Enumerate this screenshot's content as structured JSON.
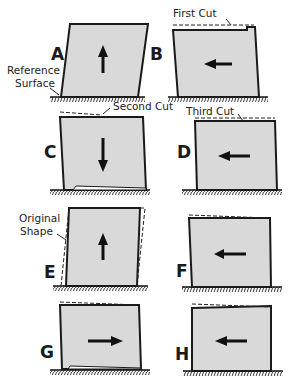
{
  "diagram": {
    "title": "",
    "panels": [
      {
        "id": "A",
        "label": "A",
        "arrow_direction": "up"
      },
      {
        "id": "B",
        "label": "B",
        "arrow_direction": "left"
      },
      {
        "id": "C",
        "label": "C",
        "arrow_direction": "down"
      },
      {
        "id": "D",
        "label": "D",
        "arrow_direction": "left"
      },
      {
        "id": "E",
        "label": "E",
        "arrow_direction": "up"
      },
      {
        "id": "F",
        "label": "F",
        "arrow_direction": "left"
      },
      {
        "id": "G",
        "label": "G",
        "arrow_direction": "right"
      },
      {
        "id": "H",
        "label": "H",
        "arrow_direction": "left"
      }
    ],
    "annotations": {
      "reference_surface_line1": "Reference",
      "reference_surface_line2": "Surface",
      "first_cut": "First Cut",
      "second_cut": "Second Cut",
      "third_cut": "Third Cut",
      "original_shape_line1": "Original",
      "original_shape_line2": "Shape"
    },
    "colors": {
      "block_fill": "#d9d9d9",
      "outline": "#1a1a1a",
      "background": "#ffffff"
    }
  }
}
